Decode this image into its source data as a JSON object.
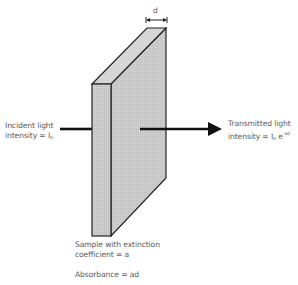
{
  "diagram": {
    "thickness_label": "d",
    "incident": {
      "line1": "Incident light",
      "line2_prefix": "intensity = I",
      "line2_sub": "o"
    },
    "transmitted": {
      "line1": "Transmitted light",
      "line2_prefix": "intensity = I",
      "line2_sub": "o",
      "line2_mid": " e",
      "line2_sup": "-ad"
    },
    "sample": {
      "line1": "Sample with extinction",
      "line2": "coefficient = a"
    },
    "absorbance": "Absorbance = ad",
    "colors": {
      "face_front": "#c8c8c8",
      "face_side": "#d2d2d2",
      "face_top": "#dadada",
      "outline": "#222222",
      "arrow": "#111111",
      "text": "#5a5a5a"
    }
  }
}
